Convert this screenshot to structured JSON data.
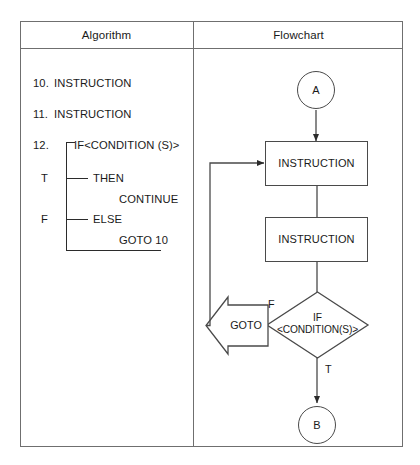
{
  "figure": {
    "caption_fragment": "",
    "columns": [
      {
        "key": "algorithm",
        "header": "Algorithm"
      },
      {
        "key": "flowchart",
        "header": "Flowchart"
      }
    ]
  },
  "algorithm": {
    "lines": [
      {
        "number": "10.",
        "text": "INSTRUCTION"
      },
      {
        "number": "11.",
        "text": "INSTRUCTION"
      },
      {
        "number": "12.",
        "text": "IF<CONDITION (S)>"
      }
    ],
    "branches": [
      {
        "flag": "T",
        "keyword": "THEN",
        "body": "CONTINUE"
      },
      {
        "flag": "F",
        "keyword": "ELSE",
        "body": "GOTO 10"
      }
    ]
  },
  "flowchart": {
    "nodes": [
      {
        "id": "start",
        "shape": "circle",
        "label": "A"
      },
      {
        "id": "inst1",
        "shape": "process",
        "label": "INSTRUCTION"
      },
      {
        "id": "inst2",
        "shape": "process",
        "label": "INSTRUCTION"
      },
      {
        "id": "cond",
        "shape": "decision",
        "label_line1": "IF",
        "label_line2": "<CONDITION(S)>"
      },
      {
        "id": "goto",
        "shape": "arrow-left",
        "label": "GOTO"
      },
      {
        "id": "end",
        "shape": "circle",
        "label": "B"
      }
    ],
    "edge_labels": [
      {
        "id": "false-branch",
        "label": "F"
      },
      {
        "id": "true-branch",
        "label": "T"
      }
    ]
  },
  "style": {
    "line_color": "#4a4a4a",
    "text_color": "#1a1a1a",
    "background": "#ffffff"
  }
}
